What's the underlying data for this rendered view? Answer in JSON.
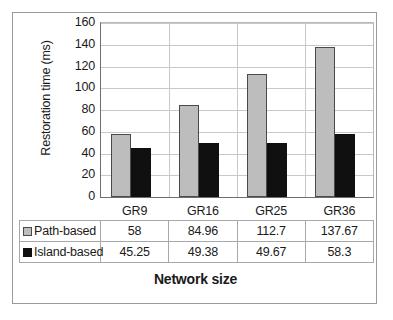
{
  "chart_data": {
    "type": "bar",
    "title": "",
    "xlabel": "Network size",
    "ylabel": "Restoration time (ms)",
    "categories": [
      "GR9",
      "GR16",
      "GR25",
      "GR36"
    ],
    "series": [
      {
        "name": "Path-based",
        "values": [
          58,
          84.96,
          112.7,
          137.67
        ],
        "color": "#bdbdbd"
      },
      {
        "name": "Island-based",
        "values": [
          45.25,
          49.38,
          49.67,
          58.3
        ],
        "color": "#101010"
      }
    ],
    "ylim": [
      0,
      160
    ],
    "ytick_step": 20,
    "yticks": [
      0,
      20,
      40,
      60,
      80,
      100,
      120,
      140,
      160
    ],
    "ytick_labels": [
      "0",
      "20",
      "40",
      "60",
      "80",
      "100",
      "120",
      "140",
      "160"
    ],
    "grid": true,
    "legend_position": "data-table",
    "data_table": {
      "row_labels": [
        "Path-based",
        "Island-based"
      ],
      "columns": [
        "GR9",
        "GR16",
        "GR25",
        "GR36"
      ],
      "rows": [
        [
          "58",
          "84.96",
          "112.7",
          "137.67"
        ],
        [
          "45.25",
          "49.38",
          "49.67",
          "58.3"
        ]
      ]
    }
  }
}
